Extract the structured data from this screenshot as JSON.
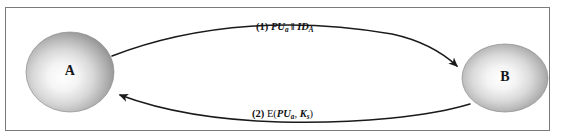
{
  "figure": {
    "type": "protocol-message-diagram",
    "background_color": "#ffffff",
    "border_color": "#7b7b7b",
    "nodes": [
      {
        "id": "A",
        "label": "A",
        "shape": "ellipse",
        "fill": "radial-gradient-gray",
        "highlight_color": "#ffffff",
        "edge_color": "#8d8d8d",
        "center": [
          70,
          72
        ],
        "radius": [
          44,
          40
        ]
      },
      {
        "id": "B",
        "label": "B",
        "shape": "ellipse",
        "fill": "radial-gradient-gray",
        "highlight_color": "#ffffff",
        "edge_color": "#8d8d8d",
        "center": [
          505,
          78
        ],
        "radius": [
          43,
          34
        ]
      }
    ],
    "edges": [
      {
        "id": "edge-1",
        "from": "A",
        "to": "B",
        "direction": "A-to-B",
        "curve": "arc-up",
        "stroke_color": "#1a1a1a",
        "label_number": "(1)",
        "label_text": "PUa || IDA",
        "label_parts": {
          "number": "(1)",
          "key": "PU",
          "key_sub": "a",
          "concat": "‖",
          "identity": "ID",
          "identity_sub": "A"
        }
      },
      {
        "id": "edge-2",
        "from": "B",
        "to": "A",
        "direction": "B-to-A",
        "curve": "arc-down",
        "stroke_color": "#1a1a1a",
        "label_number": "(2)",
        "label_text": "E(PUa, Ks)",
        "label_parts": {
          "number": "(2)",
          "func": "E(",
          "key": "PU",
          "key_sub": "a",
          "sep": ", ",
          "session_key": "K",
          "session_key_sub": "s",
          "close": ")"
        }
      }
    ]
  }
}
